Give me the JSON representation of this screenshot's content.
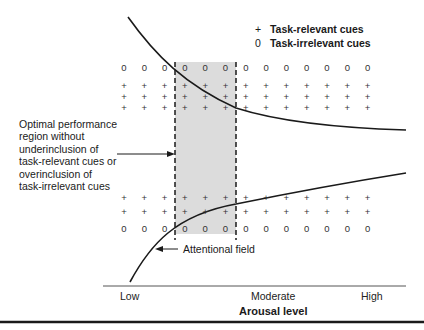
{
  "legend": {
    "items": [
      {
        "symbol": "+",
        "label": "Task-relevant cues"
      },
      {
        "symbol": "0",
        "label": "Task-irrelevant cues"
      }
    ]
  },
  "annotations": {
    "optimal_region": "Optimal performance\nregion without\nunderinclusion of\ntask-relevant cues or\noverinclusion of\ntask-irrelevant cues",
    "attentional_field": "Attentional field"
  },
  "axis": {
    "title": "Arousal level",
    "ticks": [
      "Low",
      "Moderate",
      "High"
    ]
  },
  "grid": {
    "columns": 13,
    "top_rows": [
      "0",
      "+",
      "+",
      "+"
    ],
    "bottom_rows": [
      "+",
      "+",
      "0"
    ]
  },
  "colors": {
    "shade": "#dcdcdc",
    "line": "#1a1a1a"
  }
}
